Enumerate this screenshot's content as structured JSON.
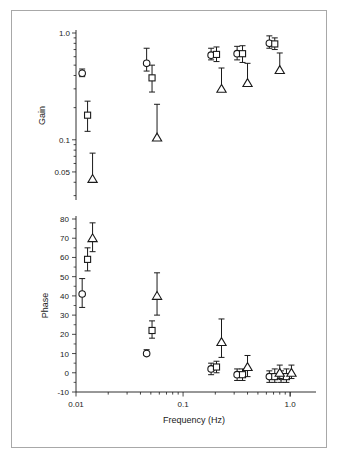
{
  "figure": {
    "xlabel": "Frequency (Hz)",
    "panels": [
      "Gain",
      "Phase"
    ]
  },
  "chart_data": [
    {
      "type": "scatter",
      "title": "",
      "xlabel": "Frequency (Hz)",
      "ylabel": "Gain",
      "xscale": "log",
      "yscale": "log",
      "xlim": [
        0.01,
        1.6
      ],
      "ylim": [
        0.03,
        1.1
      ],
      "xticks": [
        0.01,
        0.1,
        1.0
      ],
      "xtick_labels": [
        "0.01",
        "0.1",
        "1.0"
      ],
      "yticks": [
        1.0,
        0.1,
        0.05
      ],
      "ytick_labels": [
        "1.0",
        "0.1",
        "0.05"
      ],
      "grid": false,
      "legend": "none",
      "x": [
        0.0125,
        0.05,
        0.2,
        0.35,
        0.7,
        0.9
      ],
      "series": [
        {
          "name": "circle",
          "marker": "circle",
          "values": [
            0.42,
            0.52,
            0.62,
            0.64,
            0.8,
            null
          ],
          "err_low": [
            0.39,
            0.44,
            0.56,
            0.56,
            0.72,
            null
          ],
          "err_high": [
            0.46,
            0.72,
            0.72,
            0.75,
            0.94,
            null
          ]
        },
        {
          "name": "square",
          "marker": "square",
          "values": [
            0.17,
            0.38,
            0.63,
            0.64,
            0.79,
            null
          ],
          "err_low": [
            0.12,
            0.28,
            0.54,
            0.53,
            0.7,
            null
          ],
          "err_high": [
            0.23,
            0.5,
            0.74,
            0.76,
            0.9,
            null
          ]
        },
        {
          "name": "triangle",
          "marker": "triangle",
          "values": [
            0.043,
            0.105,
            0.3,
            0.34,
            0.45,
            null
          ],
          "err_low": [
            0.043,
            0.105,
            0.3,
            0.34,
            0.45,
            null
          ],
          "err_high": [
            0.075,
            0.215,
            0.47,
            0.52,
            0.65,
            null
          ]
        }
      ]
    },
    {
      "type": "scatter",
      "title": "",
      "xlabel": "Frequency (Hz)",
      "ylabel": "Phase",
      "xscale": "log",
      "yscale": "linear",
      "xlim": [
        0.01,
        1.6
      ],
      "ylim": [
        -10,
        80
      ],
      "xticks": [
        0.01,
        0.1,
        1.0
      ],
      "xtick_labels": [
        "0.01",
        "0.1",
        "1.0"
      ],
      "yticks": [
        -10,
        0,
        10,
        20,
        30,
        40,
        50,
        60,
        70,
        80
      ],
      "ytick_labels": [
        "-10",
        "0",
        "10",
        "20",
        "30",
        "40",
        "50",
        "60",
        "70",
        "80"
      ],
      "grid": false,
      "legend": "none",
      "x": [
        0.0125,
        0.05,
        0.2,
        0.35,
        0.7,
        0.9
      ],
      "series": [
        {
          "name": "circle",
          "marker": "circle",
          "values": [
            41,
            10,
            2,
            -1,
            -2,
            -2
          ],
          "err_low": [
            34,
            9,
            -1,
            -4,
            -5,
            -5
          ],
          "err_high": [
            49,
            12,
            5,
            2,
            1,
            1
          ]
        },
        {
          "name": "square",
          "marker": "square",
          "values": [
            59,
            22,
            3,
            -1,
            -2,
            -2
          ],
          "err_low": [
            53,
            18,
            0,
            -4,
            -5,
            -5
          ],
          "err_high": [
            65,
            27,
            6,
            2,
            2,
            2
          ]
        },
        {
          "name": "triangle",
          "marker": "triangle",
          "values": [
            70,
            40,
            16,
            3,
            0,
            0
          ],
          "err_low": [
            63,
            30,
            8,
            -2,
            -3,
            -3
          ],
          "err_high": [
            78,
            52,
            28,
            9,
            4,
            4
          ]
        }
      ]
    }
  ]
}
